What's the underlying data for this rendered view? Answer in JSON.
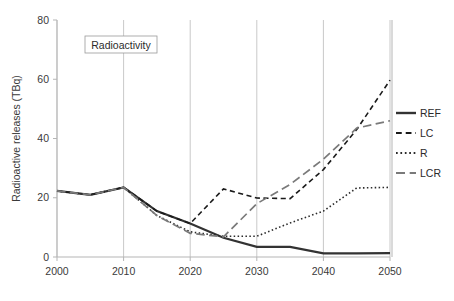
{
  "chart_data": {
    "type": "line",
    "title": "",
    "annotation": "Radioactivity",
    "xlabel": "",
    "ylabel": "Radioactive releases (TBq)",
    "xlim": [
      2000,
      2050
    ],
    "ylim": [
      0,
      80
    ],
    "xticks": [
      2000,
      2010,
      2020,
      2030,
      2040,
      2050
    ],
    "yticks": [
      0,
      20,
      40,
      60,
      80
    ],
    "xtick_labels": [
      "2000",
      "2010",
      "2020",
      "2030",
      "2040",
      "2050"
    ],
    "ytick_labels": [
      "0",
      "20",
      "40",
      "60",
      "80"
    ],
    "grid": "vertical",
    "legend_position": "right",
    "x": [
      2000,
      2005,
      2010,
      2015,
      2020,
      2025,
      2030,
      2035,
      2040,
      2045,
      2050
    ],
    "series": [
      {
        "name": "REF",
        "style": "solid",
        "color": "#333333",
        "width": 2.2,
        "values": [
          22.3,
          21.0,
          23.5,
          15.5,
          11.3,
          6.5,
          3.4,
          3.4,
          1.2,
          1.2,
          1.3
        ]
      },
      {
        "name": "LC",
        "style": "dashed",
        "color": "#1a1a1a",
        "width": 1.6,
        "values": [
          22.3,
          21.0,
          23.5,
          15.5,
          11.3,
          23.0,
          19.9,
          19.7,
          29.5,
          43.0,
          59.7
        ]
      },
      {
        "name": "R",
        "style": "dotted",
        "color": "#2b2b2b",
        "width": 1.6,
        "values": [
          22.3,
          21.0,
          23.5,
          14.0,
          8.5,
          7.0,
          7.0,
          11.5,
          15.5,
          23.3,
          23.5
        ]
      },
      {
        "name": "LCR",
        "style": "longdash",
        "color": "#7a7a7a",
        "width": 1.7,
        "values": [
          22.3,
          21.0,
          23.5,
          14.0,
          8.0,
          6.8,
          18.0,
          24.5,
          33.0,
          43.5,
          46.0
        ]
      }
    ],
    "legend": [
      {
        "label": "REF",
        "style": "solid",
        "color": "#333333"
      },
      {
        "label": "LC",
        "style": "dashed",
        "color": "#1a1a1a"
      },
      {
        "label": "R",
        "style": "dotted",
        "color": "#2b2b2b"
      },
      {
        "label": "LCR",
        "style": "longdash",
        "color": "#7a7a7a"
      }
    ],
    "colors": {
      "grid": "#c9c9c9",
      "axis": "#b5b5b5",
      "text": "#2b2b2b",
      "background": "#ffffff"
    }
  }
}
